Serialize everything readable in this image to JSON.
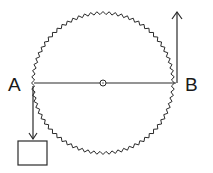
{
  "diagram": {
    "type": "wheel-and-load",
    "labels": {
      "left": "A",
      "right": "B"
    },
    "wheel": {
      "cx": 103,
      "cy": 83,
      "r": 70,
      "teeth": 72,
      "tooth_depth": 3
    },
    "diameter_line": {
      "from": "A",
      "to": "B",
      "center_marker": "axle"
    },
    "arrows": [
      {
        "id": "force-up-at-B",
        "direction": "up"
      },
      {
        "id": "force-down-at-A",
        "direction": "down"
      }
    ],
    "load": {
      "shape": "box"
    },
    "stroke_color": "#2a2a2a"
  }
}
